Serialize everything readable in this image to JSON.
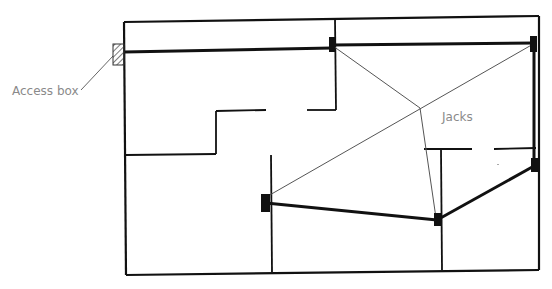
{
  "diagram": {
    "type": "floor-plan-wiring",
    "labels": {
      "access_box": "Access box",
      "jacks": "Jacks"
    },
    "colors": {
      "wall": "#111111",
      "cable": "#111111",
      "signal_line": "#555555",
      "label": "#8a8a8a"
    },
    "nodes": [
      {
        "id": "access-box",
        "x": 119,
        "y": 51
      },
      {
        "id": "jack-top-middle",
        "x": 332,
        "y": 45
      },
      {
        "id": "jack-top-right",
        "x": 534,
        "y": 45
      },
      {
        "id": "jack-left-center",
        "x": 266,
        "y": 203
      },
      {
        "id": "jack-bottom-middle",
        "x": 437,
        "y": 220
      },
      {
        "id": "jack-right",
        "x": 534,
        "y": 165
      }
    ]
  }
}
